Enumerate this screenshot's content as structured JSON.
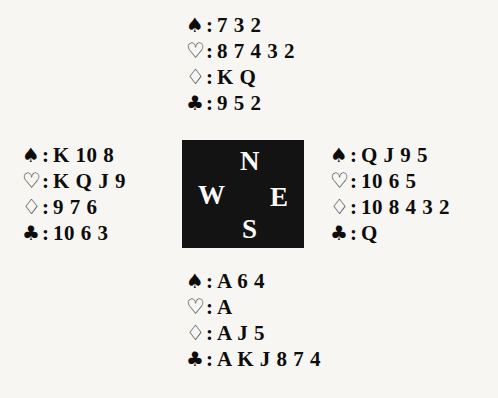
{
  "diagram": {
    "type": "bridge-deal-diagram",
    "background_color": "#f7f6f3",
    "ink_color": "#0d0d0d"
  },
  "suits": {
    "spade": {
      "symbol": "♠",
      "name": "spade-symbol",
      "style": "filled"
    },
    "heart": {
      "symbol": "♡",
      "name": "heart-symbol",
      "style": "hollow"
    },
    "diamond": {
      "symbol": "♢",
      "name": "diamond-symbol",
      "style": "hollow"
    },
    "club": {
      "symbol": "♣",
      "name": "club-symbol",
      "style": "filled"
    },
    "separator": ":"
  },
  "compass": {
    "background_color": "#131313",
    "text_color": "#fbfbf8",
    "north": "N",
    "west": "W",
    "east": "E",
    "south": "S"
  },
  "hands": {
    "north": {
      "position": "North",
      "spades": "7 3 2",
      "hearts": "8 7 4 3 2",
      "diamonds": "K Q",
      "clubs": "9 5 2"
    },
    "west": {
      "position": "West",
      "spades": "K 10 8",
      "hearts": "K Q J 9",
      "diamonds": "9 7 6",
      "clubs": "10 6 3"
    },
    "east": {
      "position": "East",
      "spades": "Q J 9 5",
      "hearts": "10 6 5",
      "diamonds": "10 8 4 3 2",
      "clubs": "Q"
    },
    "south": {
      "position": "South",
      "spades": "A 6 4",
      "hearts": "A",
      "diamonds": "A J 5",
      "clubs": "A K J 8 7 4"
    }
  }
}
